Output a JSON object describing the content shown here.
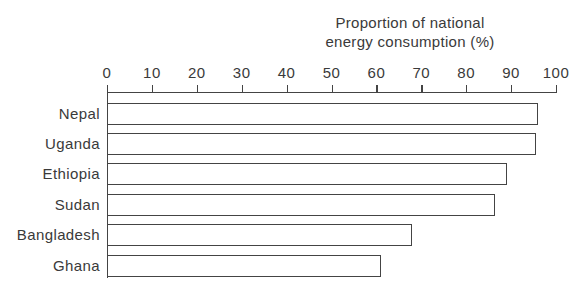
{
  "chart_data": {
    "type": "bar",
    "orientation": "horizontal",
    "title_lines": [
      "Proportion of national",
      "energy consumption (%)"
    ],
    "xlabel": "Proportion of national energy consumption (%)",
    "ylabel": "",
    "xlim": [
      0,
      100
    ],
    "x_ticks": [
      "0",
      "10",
      "20",
      "30",
      "40",
      "50",
      "60",
      "70",
      "80",
      "90",
      "100"
    ],
    "axis_position": "top",
    "grid": false,
    "legend": null,
    "categories": [
      "Nepal",
      "Uganda",
      "Ethiopia",
      "Sudan",
      "Bangladesh",
      "Ghana"
    ],
    "values": [
      96,
      95.5,
      89,
      86.5,
      68,
      61
    ]
  }
}
